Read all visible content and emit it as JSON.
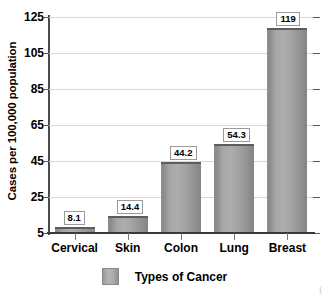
{
  "chart_data": {
    "type": "bar",
    "title": "",
    "categories": [
      "Cervical",
      "Skin",
      "Colon",
      "Lung",
      "Breast"
    ],
    "values": [
      8.1,
      14.4,
      44.2,
      54.3,
      119
    ],
    "value_labels": [
      "8.1",
      "14.4",
      "44.2",
      "54.3",
      "119"
    ],
    "xlabel": "Types of Cancer",
    "ylabel": "Cases per 100,000 population",
    "ylim": [
      5,
      125
    ],
    "ytick_labels": [
      "125",
      "105",
      "85",
      "65",
      "45",
      "25",
      "5"
    ],
    "ytick_values": [
      125,
      105,
      85,
      65,
      45,
      25,
      5
    ],
    "grid": true,
    "legend": {
      "position": "bottom",
      "entries": [
        {
          "label": "Types of Cancer",
          "color": "#a8a8a8"
        }
      ]
    },
    "series": [
      {
        "name": "Types of Cancer",
        "color": "#a8a8a8",
        "values": [
          8.1,
          14.4,
          44.2,
          54.3,
          119
        ]
      }
    ]
  },
  "colors": {
    "bar_fill": "#a8a8a8",
    "bar_edge": "#5d5d5d",
    "gridline": "#d8d8d8",
    "axis": "#3a3a3a",
    "label_box_border": "#9a9a9a",
    "background": "#ffffff"
  },
  "artifact": {
    "mark": "("
  }
}
